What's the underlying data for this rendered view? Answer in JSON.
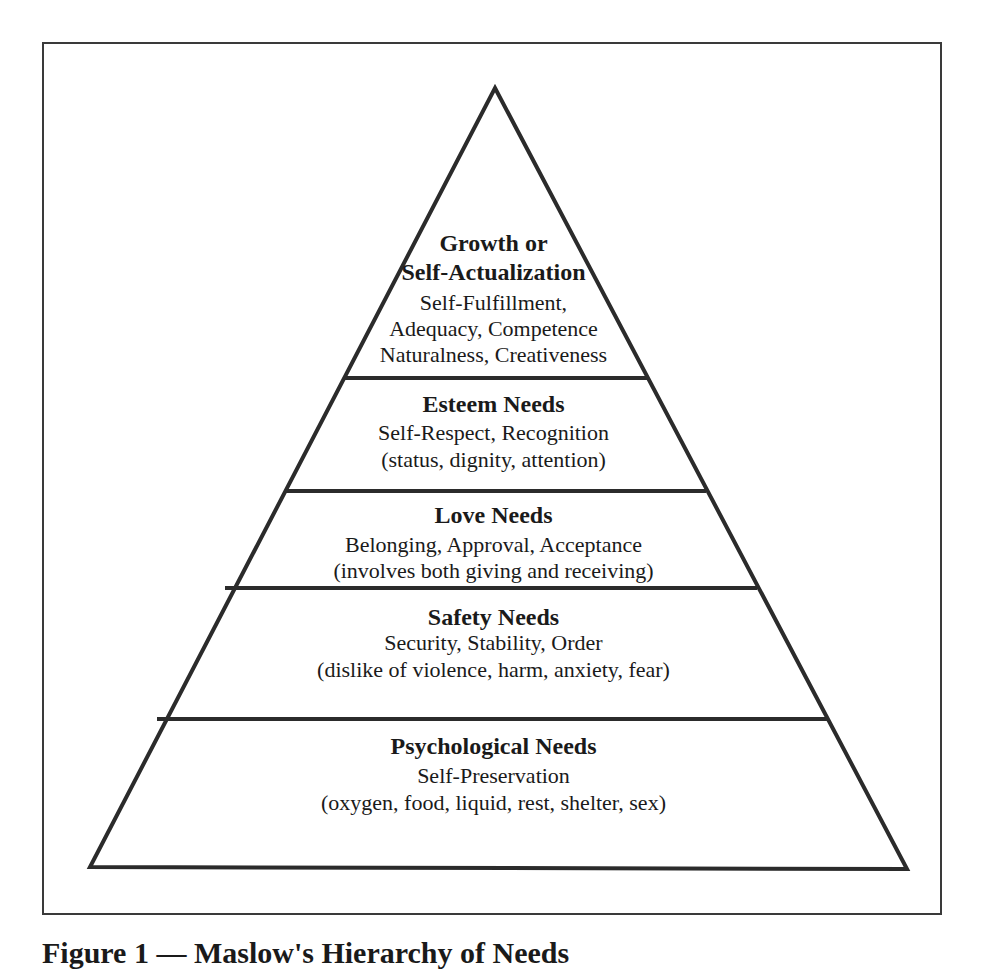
{
  "figure": {
    "type": "pyramid",
    "tiers": [
      {
        "title_lines": [
          "Growth or",
          "Self-Actualization"
        ],
        "detail_lines": [
          "Self-Fulfillment,",
          "Adequacy, Competence",
          "Naturalness, Creativeness"
        ]
      },
      {
        "title_lines": [
          "Esteem Needs"
        ],
        "detail_lines": [
          "Self-Respect,  Recognition",
          "(status, dignity, attention)"
        ]
      },
      {
        "title_lines": [
          "Love Needs"
        ],
        "detail_lines": [
          "Belonging, Approval, Acceptance",
          "(involves both giving and receiving)"
        ]
      },
      {
        "title_lines": [
          "Safety Needs"
        ],
        "detail_lines": [
          "Security, Stability, Order",
          "(dislike of violence, harm, anxiety, fear)"
        ]
      },
      {
        "title_lines": [
          "Psychological Needs"
        ],
        "detail_lines": [
          "Self-Preservation",
          "(oxygen, food, liquid, rest, shelter, sex)"
        ]
      }
    ],
    "colors": {
      "stroke": "#2b2b2b",
      "frame": "#3a3a3a",
      "background": "#ffffff",
      "text": "#1a1a1a"
    }
  },
  "caption": {
    "text": "Figure 1 — Maslow's Hierarchy of Needs"
  }
}
